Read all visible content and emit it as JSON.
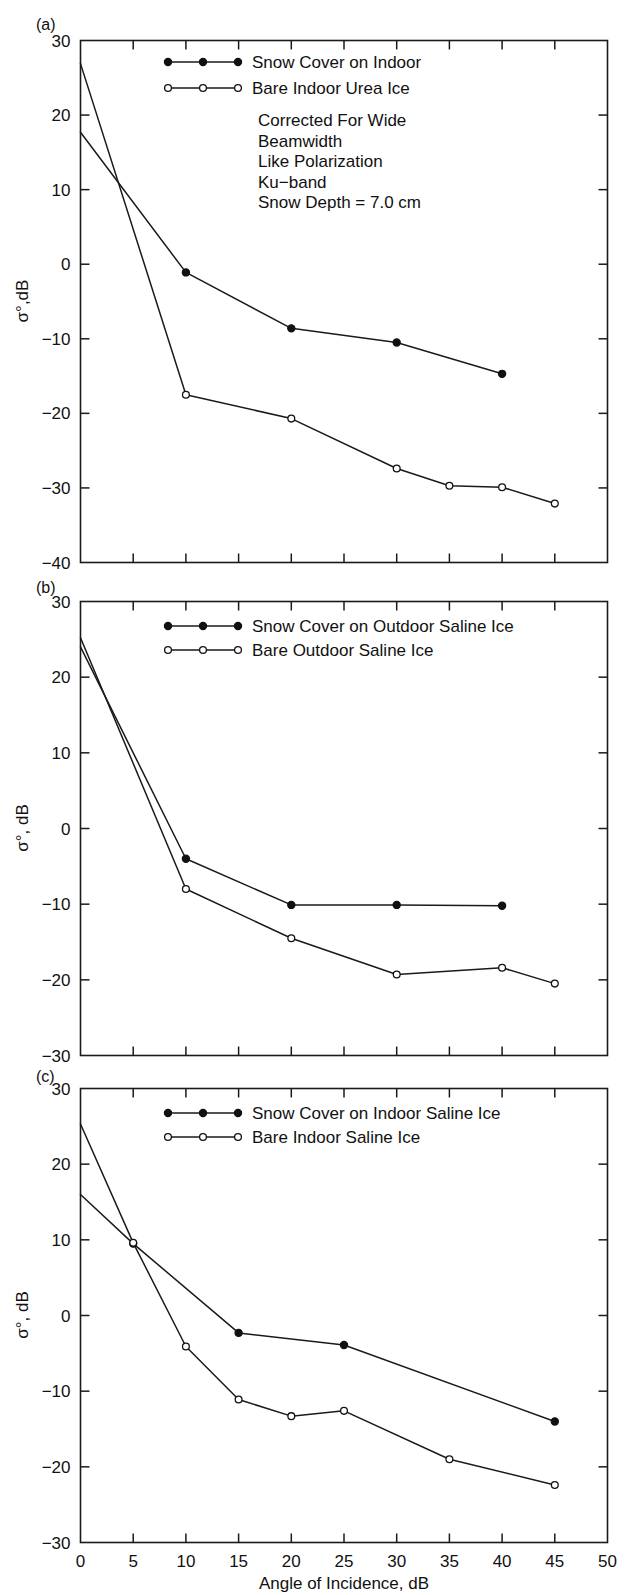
{
  "figure": {
    "xlabel": "Angle of Incidence, dB",
    "xticks": [
      0,
      5,
      10,
      15,
      20,
      25,
      30,
      35,
      40,
      45,
      50
    ],
    "xlim": [
      0,
      50
    ]
  },
  "panels": [
    {
      "tag": "(a)",
      "ylabel": "σ°,dB",
      "ylim": [
        -40,
        30
      ],
      "yticks": [
        30,
        20,
        10,
        0,
        -10,
        -20,
        -30,
        -40
      ],
      "legend": [
        {
          "label": "Snow Cover on Indoor",
          "marker": "filled"
        },
        {
          "label": "Bare Indoor Urea Ice",
          "marker": "open"
        }
      ],
      "annotation": [
        "Corrected For Wide",
        "Beamwidth",
        "Like Polarization",
        "Ku−band",
        "Snow Depth = 7.0 cm"
      ]
    },
    {
      "tag": "(b)",
      "ylabel": "σ°, dB",
      "ylim": [
        -30,
        30
      ],
      "yticks": [
        30,
        20,
        10,
        0,
        -10,
        -20,
        -30
      ],
      "legend": [
        {
          "label": "Snow Cover on Outdoor Saline Ice",
          "marker": "filled"
        },
        {
          "label": "Bare Outdoor Saline Ice",
          "marker": "open"
        }
      ],
      "annotation": []
    },
    {
      "tag": "(c)",
      "ylabel": "σ°, dB",
      "ylim": [
        -30,
        30
      ],
      "yticks": [
        30,
        20,
        10,
        0,
        -10,
        -20,
        -30
      ],
      "legend": [
        {
          "label": "Snow Cover on Indoor Saline Ice",
          "marker": "filled"
        },
        {
          "label": "Bare Indoor Saline Ice",
          "marker": "open"
        }
      ],
      "annotation": []
    }
  ],
  "chart_data": [
    {
      "type": "line",
      "panel": "(a)",
      "title": "Snow Cover on Indoor vs Bare Indoor Urea Ice",
      "xlabel": "Angle of Incidence, dB",
      "ylabel": "σ°,dB",
      "xlim": [
        0,
        50
      ],
      "ylim": [
        -40,
        30
      ],
      "grid": false,
      "legend_position": "top-center",
      "annotations": [
        "Corrected For Wide",
        "Beamwidth",
        "Like Polarization",
        "Ku−band",
        "Snow Depth = 7.0 cm"
      ],
      "series": [
        {
          "name": "Snow Cover on Indoor",
          "marker": "filled-circle",
          "x": [
            0,
            10,
            20,
            30,
            40
          ],
          "values": [
            17.7,
            -1.1,
            -8.6,
            -10.5,
            -14.7
          ]
        },
        {
          "name": "Bare Indoor Urea Ice",
          "marker": "open-circle",
          "x": [
            0,
            10,
            20,
            30,
            35,
            40,
            45
          ],
          "values": [
            26.9,
            -17.5,
            -20.7,
            -27.4,
            -29.7,
            -29.9,
            -32.1
          ]
        }
      ]
    },
    {
      "type": "line",
      "panel": "(b)",
      "title": "Snow Cover on Outdoor Saline Ice vs Bare Outdoor Saline Ice",
      "xlabel": "Angle of Incidence, dB",
      "ylabel": "σ°, dB",
      "xlim": [
        0,
        50
      ],
      "ylim": [
        -30,
        30
      ],
      "grid": false,
      "legend_position": "top-center",
      "annotations": [],
      "series": [
        {
          "name": "Snow Cover on Outdoor Saline Ice",
          "marker": "filled-circle",
          "x": [
            0,
            10,
            20,
            30,
            40
          ],
          "values": [
            24.0,
            -4.0,
            -10.1,
            -10.1,
            -10.2
          ]
        },
        {
          "name": "Bare Outdoor Saline Ice",
          "marker": "open-circle",
          "x": [
            0,
            10,
            20,
            30,
            40,
            45
          ],
          "values": [
            25.2,
            -8.0,
            -14.5,
            -19.3,
            -18.4,
            -20.5
          ]
        }
      ]
    },
    {
      "type": "line",
      "panel": "(c)",
      "title": "Snow Cover on Indoor Saline Ice vs Bare Indoor Saline Ice",
      "xlabel": "Angle of Incidence, dB",
      "ylabel": "σ°, dB",
      "xlim": [
        0,
        50
      ],
      "ylim": [
        -30,
        30
      ],
      "grid": false,
      "legend_position": "top-center",
      "annotations": [],
      "series": [
        {
          "name": "Snow Cover on Indoor Saline Ice",
          "marker": "filled-circle",
          "x": [
            0,
            5,
            15,
            25,
            45
          ],
          "values": [
            16.0,
            9.5,
            -2.3,
            -3.9,
            -14.0
          ]
        },
        {
          "name": "Bare Indoor Saline Ice",
          "marker": "open-circle",
          "x": [
            0,
            5,
            10,
            15,
            20,
            25,
            35,
            45
          ],
          "values": [
            25.3,
            9.6,
            -4.1,
            -11.1,
            -13.3,
            -12.6,
            -19.0,
            -22.4
          ]
        }
      ]
    }
  ]
}
